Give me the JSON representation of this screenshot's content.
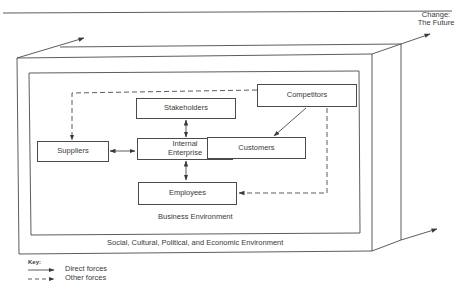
{
  "diagram": {
    "corner_label_line1": "Change:",
    "corner_label_line2": "The Future",
    "nodes": {
      "stakeholders": "Stakeholders",
      "competitors": "Competitors",
      "suppliers": "Suppliers",
      "internal_enterprise_line1": "Internal",
      "internal_enterprise_line2": "Enterprise",
      "customers": "Customers",
      "employees": "Employees"
    },
    "inner_environment_label": "Business Environment",
    "outer_environment_label": "Social, Cultural, Political, and Economic Environment",
    "edges": [
      {
        "from": "Stakeholders",
        "to": "Internal Enterprise",
        "type": "direct",
        "bidirectional": true
      },
      {
        "from": "Suppliers",
        "to": "Internal Enterprise",
        "type": "direct",
        "bidirectional": true
      },
      {
        "from": "Internal Enterprise",
        "to": "Customers",
        "type": "direct",
        "bidirectional": true
      },
      {
        "from": "Internal Enterprise",
        "to": "Employees",
        "type": "direct",
        "bidirectional": true
      },
      {
        "from": "Competitors",
        "to": "Customers",
        "type": "direct",
        "bidirectional": false
      },
      {
        "from": "Competitors",
        "to": "Suppliers",
        "type": "other",
        "bidirectional": false
      },
      {
        "from": "Competitors",
        "to": "Employees",
        "type": "other",
        "bidirectional": false
      }
    ]
  },
  "key": {
    "title": "Key:",
    "direct_label": "Direct forces",
    "other_label": "Other forces"
  },
  "colors": {
    "line": "#4a4a4a",
    "text": "#3a3a3a",
    "background": "#ffffff"
  }
}
